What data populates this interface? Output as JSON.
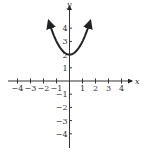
{
  "chart_data": {
    "type": "line",
    "title": "",
    "xlabel": "x",
    "ylabel": "y",
    "xlim": [
      -4.5,
      4.5
    ],
    "ylim": [
      -5,
      5.5
    ],
    "x_ticks": [
      -4,
      -3,
      -2,
      -1,
      1,
      2,
      3,
      4
    ],
    "y_ticks": [
      -4,
      -3,
      -2,
      -1,
      1,
      2,
      3,
      4
    ],
    "x_tick_labels": [
      "-4",
      "-3",
      "-2",
      "-1",
      "1",
      "2",
      "3",
      "4"
    ],
    "y_tick_labels": [
      "-4",
      "-3",
      "-2",
      "-1",
      "1",
      "2",
      "3",
      "4"
    ],
    "grid": false,
    "series": [
      {
        "name": "y = x^2 + 2",
        "function": "x^2 + 2",
        "x_range": [
          -1.6,
          1.6
        ],
        "arrows": "both-ends",
        "points": [
          [
            -1.6,
            4.56
          ],
          [
            -1.2,
            3.44
          ],
          [
            -0.8,
            2.64
          ],
          [
            -0.4,
            2.16
          ],
          [
            0,
            2
          ],
          [
            0.4,
            2.16
          ],
          [
            0.8,
            2.64
          ],
          [
            1.2,
            3.44
          ],
          [
            1.6,
            4.56
          ]
        ]
      }
    ]
  }
}
